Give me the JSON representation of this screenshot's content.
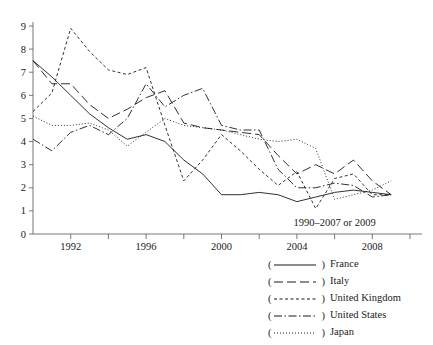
{
  "chart_data": {
    "type": "line",
    "title": "",
    "subtitle": "",
    "xlabel": "1990–2007 or 2009",
    "ylabel": "",
    "xlim": [
      1990,
      2010
    ],
    "ylim": [
      0,
      9.4
    ],
    "grid": false,
    "legend_position": "below-right",
    "x": [
      1990,
      1991,
      1992,
      1993,
      1994,
      1995,
      1996,
      1997,
      1998,
      1999,
      2000,
      2001,
      2002,
      2003,
      2004,
      2005,
      2006,
      2007,
      2008,
      2009
    ],
    "xticks": [
      1992,
      1996,
      2000,
      2004,
      2008
    ],
    "xticklabels": [
      "1992",
      "1996",
      "2000",
      "2004",
      "2008"
    ],
    "xminorticks": [
      1994,
      1998,
      2002,
      2006,
      2010
    ],
    "yticks": [
      0,
      1,
      2,
      3,
      4,
      5,
      6,
      7,
      8,
      9
    ],
    "yticklabels": [
      "0",
      "1",
      "2",
      "3",
      "4",
      "5",
      "6",
      "7",
      "8",
      "9"
    ],
    "series": [
      {
        "name": "France",
        "style": "solid",
        "dasharray": "",
        "values": [
          7.5,
          6.8,
          6.0,
          5.2,
          4.6,
          4.1,
          4.3,
          4.0,
          3.2,
          2.6,
          1.7,
          1.7,
          1.8,
          1.7,
          1.4,
          1.6,
          1.8,
          1.9,
          1.8,
          1.7
        ]
      },
      {
        "name": "Italy",
        "style": "long-dash",
        "dasharray": "9,4",
        "values": [
          7.5,
          6.5,
          6.5,
          5.6,
          5.0,
          5.4,
          5.9,
          6.2,
          4.8,
          4.6,
          4.5,
          4.4,
          4.3,
          3.4,
          2.6,
          3.0,
          2.6,
          3.2,
          2.3,
          1.7
        ]
      },
      {
        "name": "United Kingdom",
        "style": "short-dash",
        "dasharray": "3,2.5",
        "values": [
          5.3,
          6.1,
          8.9,
          7.9,
          7.1,
          6.9,
          7.2,
          4.7,
          2.3,
          3.2,
          4.3,
          3.6,
          2.8,
          2.1,
          2.7,
          1.1,
          2.4,
          2.6,
          1.7,
          1.7
        ]
      },
      {
        "name": "United States",
        "style": "dash-dot",
        "dasharray": "8,2.5,1.5,2.5",
        "values": [
          4.1,
          3.6,
          4.4,
          4.7,
          4.3,
          5.0,
          6.5,
          5.5,
          6.0,
          6.3,
          4.7,
          4.5,
          4.5,
          2.8,
          2.0,
          2.0,
          2.2,
          2.1,
          1.6,
          1.7
        ]
      },
      {
        "name": "Japan",
        "style": "dotted",
        "dasharray": "1,2",
        "values": [
          5.1,
          4.7,
          4.7,
          4.8,
          4.5,
          3.8,
          4.4,
          5.0,
          4.7,
          4.6,
          4.5,
          4.3,
          4.1,
          4.0,
          4.1,
          3.7,
          1.5,
          1.7,
          1.9,
          2.3
        ]
      }
    ]
  },
  "axis": {
    "x_axis_caption": "1990–2007 or 2009"
  },
  "legend": {
    "entries": [
      {
        "label": "France",
        "style": "solid"
      },
      {
        "label": "Italy",
        "style": "long-dash"
      },
      {
        "label": "United Kingdom",
        "style": "short-dash"
      },
      {
        "label": "United States",
        "style": "dash-dot"
      },
      {
        "label": "Japan",
        "style": "dotted"
      }
    ],
    "open_paren": "(",
    "close_paren": ")"
  },
  "colors": {
    "ink": "#1a1a1a",
    "background": "#ffffff"
  }
}
